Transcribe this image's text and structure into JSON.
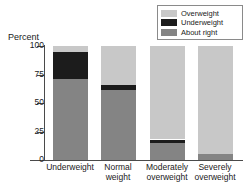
{
  "chart_data": {
    "type": "bar",
    "subtype": "stacked-bar-100",
    "title": "",
    "xlabel": "",
    "ylabel": "Percent",
    "ylim": [
      0,
      100
    ],
    "yticks": [
      0,
      25,
      50,
      75,
      100
    ],
    "ytick_labels": [
      "0",
      "25",
      "50",
      "75",
      "100"
    ],
    "grid": false,
    "legend_position": "top-right",
    "categories": [
      "Underweight",
      "Normal weight",
      "Moderately overweight",
      "Severely overweight"
    ],
    "category_lines": [
      [
        "Underweight"
      ],
      [
        "Normal",
        "weight"
      ],
      [
        "Moderately",
        "overweight"
      ],
      [
        "Severely",
        "overweight"
      ]
    ],
    "series": [
      {
        "name": "About right",
        "color": "#848484",
        "values": [
          71,
          61,
          15,
          5
        ]
      },
      {
        "name": "Underweight",
        "color": "#1c1c1c",
        "values": [
          24,
          5,
          3,
          0
        ]
      },
      {
        "name": "Overweight",
        "color": "#c8c8c8",
        "values": [
          5,
          34,
          82,
          95
        ]
      }
    ],
    "stack_order_bottom_to_top": [
      "About right",
      "Underweight",
      "Overweight"
    ]
  },
  "legend": {
    "items": [
      {
        "label": "Overweight",
        "color": "#c8c8c8"
      },
      {
        "label": "Underweight",
        "color": "#1c1c1c"
      },
      {
        "label": "About right",
        "color": "#848484"
      }
    ]
  },
  "axis": {
    "y_title": "Percent",
    "y_ticks": [
      "100",
      "75",
      "50",
      "25",
      "0"
    ]
  }
}
